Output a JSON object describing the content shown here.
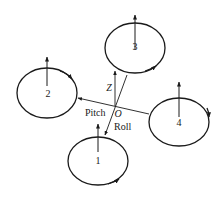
{
  "diagram": {
    "rotors": [
      {
        "id": "1",
        "label": "1",
        "spin": "counter-clockwise"
      },
      {
        "id": "2",
        "label": "2",
        "spin": "clockwise"
      },
      {
        "id": "3",
        "label": "3",
        "spin": "counter-clockwise"
      },
      {
        "id": "4",
        "label": "4",
        "spin": "clockwise"
      }
    ],
    "axes": {
      "origin": "O",
      "z": "Z",
      "pitch": "Pitch",
      "roll": "Roll"
    },
    "colors": {
      "line": "#1a1a1a",
      "background": "#ffffff"
    }
  }
}
